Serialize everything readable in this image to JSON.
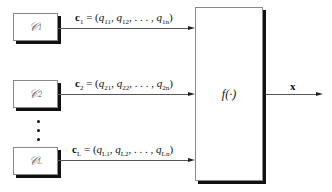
{
  "sources": [
    {
      "label": "𝒞",
      "sub": "1",
      "vec": "c",
      "vec_sub": "1",
      "q": [
        "q",
        "11",
        "q",
        "12",
        "q",
        "1n"
      ]
    },
    {
      "label": "𝒞",
      "sub": "2",
      "vec": "c",
      "vec_sub": "2",
      "q": [
        "q",
        "21",
        "q",
        "22",
        "q",
        "2n"
      ]
    },
    {
      "label": "𝒞",
      "sub": "L",
      "vec": "c",
      "vec_sub": "L",
      "q": [
        "q",
        "L1",
        "q",
        "L2",
        "q",
        "Ln"
      ]
    }
  ],
  "function_box": {
    "label": "f(·)"
  },
  "output": {
    "label": "x"
  },
  "ellipsis": "⋮"
}
